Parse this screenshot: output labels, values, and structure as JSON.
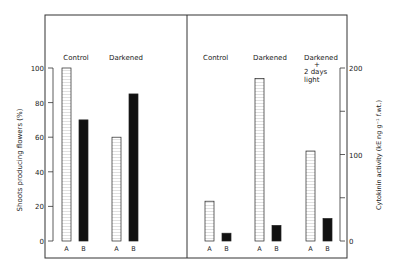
{
  "left_panel": {
    "ylabel": "Shoots producing flowers (%)",
    "yticks": [
      "0",
      "20",
      "40",
      "60",
      "80",
      "100"
    ],
    "groups": [
      {
        "label": "Control",
        "bars": [
          {
            "name": "A",
            "value": 100
          },
          {
            "name": "B",
            "value": 70
          }
        ]
      },
      {
        "label": "Darkened",
        "bars": [
          {
            "name": "A",
            "value": 60
          },
          {
            "name": "B",
            "value": 85
          }
        ]
      }
    ]
  },
  "right_panel": {
    "ylabel": "Cytokinin activity (kE ng g⁻¹ f.wt.)",
    "yticks": [
      "0",
      "100",
      "200"
    ],
    "groups": [
      {
        "label": "Control",
        "bars": [
          {
            "name": "A",
            "value": 46
          },
          {
            "name": "B",
            "value": 9
          }
        ]
      },
      {
        "label": "Darkened",
        "bars": [
          {
            "name": "A",
            "value": 188
          },
          {
            "name": "B",
            "value": 18
          }
        ]
      },
      {
        "label_lines": [
          "Darkened",
          "+",
          "2 days",
          "light"
        ],
        "bars": [
          {
            "name": "A",
            "value": 104
          },
          {
            "name": "B",
            "value": 26
          }
        ]
      }
    ]
  },
  "chart_data": [
    {
      "type": "bar",
      "title": "",
      "categories": [
        "Control",
        "Darkened"
      ],
      "series": [
        {
          "name": "A",
          "values": [
            100,
            60
          ]
        },
        {
          "name": "B",
          "values": [
            70,
            85
          ]
        }
      ],
      "xlabel": "",
      "ylabel": "Shoots producing flowers (%)",
      "ylim": [
        0,
        100
      ],
      "yticks": [
        0,
        20,
        40,
        60,
        80,
        100
      ],
      "grid": false,
      "legend": "none (A = hatched/open bar, B = solid black bar)"
    },
    {
      "type": "bar",
      "title": "",
      "categories": [
        "Control",
        "Darkened",
        "Darkened + 2 days light"
      ],
      "series": [
        {
          "name": "A",
          "values": [
            46,
            188,
            104
          ]
        },
        {
          "name": "B",
          "values": [
            9,
            18,
            26
          ]
        }
      ],
      "xlabel": "",
      "ylabel": "Cytokinin activity (kE ng g^-1 f.wt.)",
      "ylim": [
        0,
        200
      ],
      "yticks": [
        0,
        100,
        200
      ],
      "y_axis_position": "right",
      "grid": false,
      "legend": "none (A = hatched/open bar, B = solid black bar)"
    }
  ]
}
